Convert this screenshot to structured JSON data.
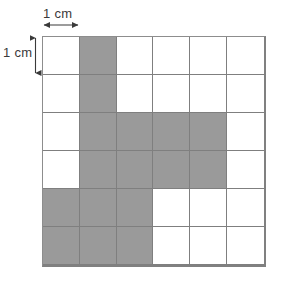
{
  "figure": {
    "labels": {
      "horizontal": "1 cm",
      "vertical": "1 cm"
    },
    "colors": {
      "shaded": "#9a9a9a",
      "unshaded": "#ffffff",
      "gridline": "#7f7f7f",
      "border": "#808080",
      "text": "#3a3a3a",
      "background": "#ffffff"
    }
  },
  "chart_data": {
    "type": "heatmap",
    "title": "",
    "xlabel": "1 cm",
    "ylabel": "1 cm",
    "columns": 6,
    "rows": 6,
    "cell_width_cm": 1,
    "cell_height_cm": 1,
    "legend": [],
    "grid": true,
    "shaded_count": 16,
    "unshaded_count": 20,
    "total_cells": 36,
    "values": [
      [
        0,
        1,
        0,
        0,
        0,
        0
      ],
      [
        0,
        1,
        0,
        0,
        0,
        0
      ],
      [
        0,
        1,
        1,
        1,
        1,
        0
      ],
      [
        0,
        1,
        1,
        1,
        1,
        0
      ],
      [
        1,
        1,
        1,
        0,
        0,
        0
      ],
      [
        1,
        1,
        1,
        0,
        0,
        0
      ]
    ],
    "shaded_cells": [
      {
        "row": 1,
        "col": 2
      },
      {
        "row": 2,
        "col": 2
      },
      {
        "row": 3,
        "col": 2
      },
      {
        "row": 3,
        "col": 3
      },
      {
        "row": 3,
        "col": 4
      },
      {
        "row": 3,
        "col": 5
      },
      {
        "row": 4,
        "col": 2
      },
      {
        "row": 4,
        "col": 3
      },
      {
        "row": 4,
        "col": 4
      },
      {
        "row": 4,
        "col": 5
      },
      {
        "row": 5,
        "col": 1
      },
      {
        "row": 5,
        "col": 2
      },
      {
        "row": 5,
        "col": 3
      },
      {
        "row": 6,
        "col": 1
      },
      {
        "row": 6,
        "col": 2
      },
      {
        "row": 6,
        "col": 3
      }
    ]
  }
}
